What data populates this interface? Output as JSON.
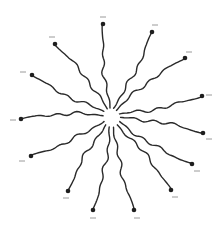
{
  "diagram": {
    "type": "radial-star",
    "center": {
      "x": 112,
      "y": 118,
      "core_radius": 8
    },
    "colors": {
      "background": "#ffffff",
      "strand": "#2a2a2a",
      "dot": "#1e1e1e",
      "label": "#9a9a9a"
    },
    "arms": [
      {
        "id": "arm-1",
        "start": [
          110,
          108
        ],
        "end": [
          103,
          24
        ],
        "label_pos": [
          103,
          17
        ]
      },
      {
        "id": "arm-2",
        "start": [
          113,
          108
        ],
        "end": [
          152,
          32
        ],
        "label_pos": [
          155,
          25
        ]
      },
      {
        "id": "arm-3",
        "start": [
          116,
          110
        ],
        "end": [
          185,
          58
        ],
        "label_pos": [
          189,
          52
        ]
      },
      {
        "id": "arm-4",
        "start": [
          119,
          114
        ],
        "end": [
          202,
          96
        ],
        "label_pos": [
          209,
          95
        ]
      },
      {
        "id": "arm-5",
        "start": [
          120,
          118
        ],
        "end": [
          203,
          133
        ],
        "label_pos": [
          209,
          139
        ]
      },
      {
        "id": "arm-6",
        "start": [
          119,
          122
        ],
        "end": [
          192,
          164
        ],
        "label_pos": [
          197,
          171
        ]
      },
      {
        "id": "arm-7",
        "start": [
          117,
          125
        ],
        "end": [
          171,
          190
        ],
        "label_pos": [
          175,
          197
        ]
      },
      {
        "id": "arm-8",
        "start": [
          114,
          127
        ],
        "end": [
          134,
          210
        ],
        "label_pos": [
          137,
          218
        ]
      },
      {
        "id": "arm-9",
        "start": [
          110,
          127
        ],
        "end": [
          93,
          210
        ],
        "label_pos": [
          93,
          218
        ]
      },
      {
        "id": "arm-10",
        "start": [
          106,
          125
        ],
        "end": [
          68,
          191
        ],
        "label_pos": [
          66,
          198
        ]
      },
      {
        "id": "arm-11",
        "start": [
          104,
          121
        ],
        "end": [
          31,
          156
        ],
        "label_pos": [
          22,
          161
        ]
      },
      {
        "id": "arm-12",
        "start": [
          103,
          115
        ],
        "end": [
          21,
          119
        ],
        "label_pos": [
          13,
          120
        ]
      },
      {
        "id": "arm-13",
        "start": [
          104,
          111
        ],
        "end": [
          32,
          75
        ],
        "label_pos": [
          23,
          72
        ]
      },
      {
        "id": "arm-14",
        "start": [
          107,
          109
        ],
        "end": [
          55,
          44
        ],
        "label_pos": [
          52,
          37
        ]
      }
    ]
  }
}
